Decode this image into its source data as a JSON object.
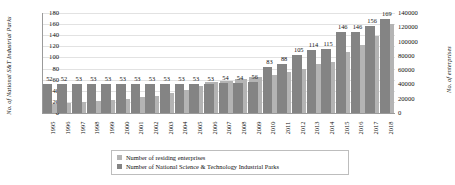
{
  "chart_data": {
    "type": "bar",
    "title": "",
    "xlabel": "",
    "categories": [
      "1995",
      "1996",
      "1997",
      "1998",
      "1999",
      "2000",
      "2001",
      "2002",
      "2003",
      "2004",
      "2005",
      "2006",
      "2007",
      "2008",
      "2009",
      "2010",
      "2011",
      "2012",
      "2013",
      "2014",
      "2015",
      "2016",
      "2017",
      "2018"
    ],
    "series": [
      {
        "name": "Number of residing enterprises",
        "axis": "right",
        "color": "#b4b4b4",
        "ylabel": "No. of enterprises",
        "ylim": [
          0,
          140000
        ],
        "yticks": [
          0,
          20000,
          40000,
          60000,
          80000,
          100000,
          120000,
          140000
        ],
        "values": [
          13000,
          14000,
          16000,
          17000,
          18000,
          20000,
          22000,
          24000,
          28000,
          32000,
          38000,
          43000,
          45000,
          48000,
          50000,
          53000,
          57000,
          62000,
          68000,
          72000,
          85000,
          95000,
          108000,
          125000
        ]
      },
      {
        "name": "Number of National Science & Technology Industrial Parks",
        "axis": "left",
        "color": "#848484",
        "ylabel": "No. of National S&T Industrial Parks",
        "ylim": [
          0,
          180
        ],
        "yticks": [
          0,
          20,
          40,
          60,
          80,
          100,
          120,
          140,
          160,
          180
        ],
        "values": [
          52,
          52,
          53,
          53,
          53,
          53,
          53,
          53,
          53,
          53,
          53,
          53,
          54,
          54,
          56,
          83,
          88,
          105,
          114,
          115,
          146,
          146,
          156,
          169
        ],
        "labels": [
          "52",
          "52",
          "53",
          "53",
          "53",
          "53",
          "53",
          "53",
          "53",
          "53",
          "53",
          "53",
          "54",
          "54",
          "56",
          "83",
          "88",
          "105",
          "114",
          "115",
          "146",
          "146",
          "156",
          "169"
        ]
      }
    ],
    "grid": true,
    "legend_position": "bottom"
  },
  "axes": {
    "left": {
      "title": "No. of National S&T Industrial Parks",
      "ticks": [
        "180",
        "160",
        "140",
        "120",
        "100",
        "80",
        "60",
        "40",
        "20",
        "0"
      ]
    },
    "right": {
      "title": "No. of enterprises",
      "ticks": [
        "140000",
        "120000",
        "100000",
        "80000",
        "60000",
        "40000",
        "20000",
        "0"
      ]
    }
  },
  "legend": {
    "items": [
      {
        "label": "Number of residing enterprises",
        "color": "#b4b4b4"
      },
      {
        "label": "Number of National Science & Technology Industrial Parks",
        "color": "#848484"
      }
    ]
  }
}
